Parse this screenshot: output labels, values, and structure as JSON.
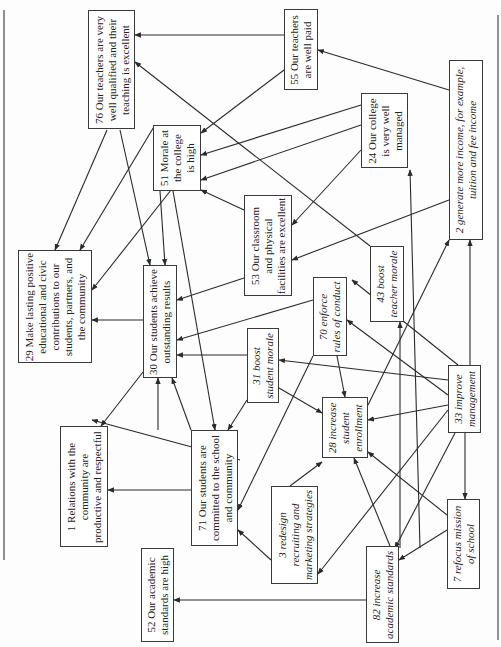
{
  "diagram": {
    "type": "causal map (rotated 90°)",
    "nodes": [
      {
        "id": "76",
        "label": "76 Our teachers are very\nwell qualified and their\nteaching is excellent",
        "style": "goal",
        "box": [
          88,
          10,
          47,
          119
        ]
      },
      {
        "id": "55",
        "label": "55 Our teachers\nare well paid",
        "style": "goal",
        "box": [
          284,
          9,
          34,
          81
        ]
      },
      {
        "id": "51",
        "label": "51 Morale at\nthe college\nis high",
        "style": "goal",
        "box": [
          153,
          125,
          48,
          66
        ]
      },
      {
        "id": "24",
        "label": "24 Our college\nis very well\nmanaged",
        "style": "goal",
        "box": [
          361,
          93,
          47,
          75
        ]
      },
      {
        "id": "2",
        "label": "2 generate more income, for example,\ntuition and fee income",
        "style": "action",
        "box": [
          449,
          60,
          34,
          180
        ]
      },
      {
        "id": "53",
        "label": "53 Our classroom\nand physical\nfacilities are excellent",
        "style": "goal",
        "box": [
          244,
          195,
          48,
          101
        ]
      },
      {
        "id": "29",
        "label": "29 Make lasting positive\neducational and civic\ncontributions to our\nstudents, partners, and\nthe community",
        "style": "goal",
        "box": [
          18,
          250,
          74,
          113
        ]
      },
      {
        "id": "30",
        "label": "30 Our students achieve\noutstanding results",
        "style": "goal",
        "box": [
          143,
          265,
          34,
          113
        ]
      },
      {
        "id": "43",
        "label": "43 boost\nteacher morale",
        "style": "action",
        "box": [
          370,
          246,
          34,
          76
        ]
      },
      {
        "id": "70",
        "label": "70 enforce\nrules of conduct",
        "style": "action",
        "box": [
          313,
          277,
          34,
          79
        ]
      },
      {
        "id": "31",
        "label": "31 boost\nstudent morale",
        "style": "action",
        "box": [
          247,
          328,
          32,
          75
        ]
      },
      {
        "id": "33",
        "label": "33 improve\nmanagement",
        "style": "action",
        "box": [
          448,
          365,
          33,
          68
        ]
      },
      {
        "id": "28",
        "label": "28 increase\nstudent\nenrollment",
        "style": "action",
        "box": [
          322,
          397,
          46,
          61
        ]
      },
      {
        "id": "1",
        "label": "1 Relations with the\ncommunity are\nproductive and respectful",
        "style": "goal",
        "box": [
          60,
          426,
          48,
          121
        ]
      },
      {
        "id": "71",
        "label": "71 Our students are\ncommitted to the school\nand community",
        "style": "goal",
        "box": [
          191,
          430,
          47,
          116
        ]
      },
      {
        "id": "3",
        "label": "3 redesign\nrecruiting and\nmarketing strategies",
        "style": "action",
        "box": [
          271,
          486,
          47,
          98
        ]
      },
      {
        "id": "7",
        "label": "7 refocus mission\nof school",
        "style": "action",
        "box": [
          447,
          499,
          33,
          90
        ]
      },
      {
        "id": "52",
        "label": "52 Our academic\nstandards are high",
        "style": "goal",
        "box": [
          141,
          548,
          33,
          94
        ]
      },
      {
        "id": "82",
        "label": "82 increase\nacademic standards",
        "style": "action",
        "box": [
          366,
          546,
          33,
          97
        ]
      }
    ],
    "edges": [
      [
        449,
        90,
        318,
        50
      ],
      [
        284,
        35,
        135,
        35
      ],
      [
        284,
        70,
        201,
        133
      ],
      [
        361,
        105,
        201,
        155
      ],
      [
        361,
        125,
        201,
        180
      ],
      [
        370,
        246,
        135,
        62
      ],
      [
        449,
        200,
        292,
        260
      ],
      [
        361,
        150,
        292,
        225
      ],
      [
        244,
        210,
        201,
        190
      ],
      [
        244,
        278,
        177,
        300
      ],
      [
        313,
        300,
        177,
        340
      ],
      [
        247,
        355,
        177,
        355
      ],
      [
        107,
        130,
        55,
        250
      ],
      [
        120,
        130,
        150,
        265
      ],
      [
        155,
        125,
        80,
        250
      ],
      [
        175,
        185,
        92,
        290
      ],
      [
        143,
        320,
        92,
        320
      ],
      [
        160,
        191,
        165,
        265
      ],
      [
        173,
        191,
        215,
        430
      ],
      [
        143,
        372,
        101,
        426
      ],
      [
        158,
        430,
        158,
        378
      ],
      [
        191,
        430,
        172,
        378
      ],
      [
        240,
        460,
        92,
        420
      ],
      [
        191,
        490,
        108,
        490
      ],
      [
        247,
        400,
        228,
        430
      ],
      [
        279,
        388,
        322,
        413
      ],
      [
        313,
        356,
        238,
        510
      ],
      [
        337,
        356,
        345,
        397
      ],
      [
        271,
        560,
        238,
        530
      ],
      [
        290,
        486,
        322,
        462
      ],
      [
        400,
        548,
        400,
        322
      ],
      [
        390,
        546,
        354,
        458
      ],
      [
        366,
        600,
        174,
        600
      ],
      [
        448,
        380,
        279,
        360
      ],
      [
        448,
        395,
        347,
        320
      ],
      [
        448,
        405,
        368,
        420
      ],
      [
        448,
        410,
        318,
        574
      ],
      [
        458,
        365,
        352,
        280
      ],
      [
        470,
        365,
        470,
        240
      ],
      [
        455,
        433,
        395,
        548
      ],
      [
        465,
        433,
        465,
        499
      ],
      [
        447,
        530,
        399,
        560
      ],
      [
        447,
        515,
        368,
        452
      ],
      [
        368,
        405,
        449,
        240
      ],
      [
        420,
        548,
        410,
        170
      ]
    ]
  }
}
